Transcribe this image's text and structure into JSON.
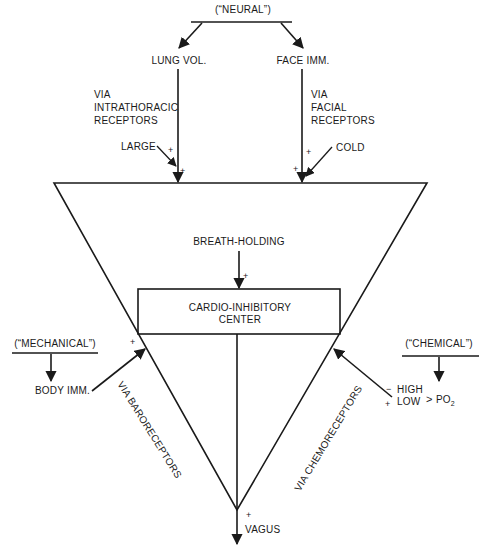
{
  "diagram": {
    "type": "cardio-inhibitory reflex pathway diagram",
    "groups": {
      "neural": {
        "label": "(“NEURAL”)"
      },
      "mechanical": {
        "label": "(“MECHANICAL”)"
      },
      "chemical": {
        "label": "(“CHEMICAL”)"
      }
    },
    "inputs": {
      "lung_vol": {
        "label": "LUNG VOL.",
        "pathway": [
          "VIA",
          "INTRATHORACIC",
          "RECEPTORS"
        ],
        "modifier": "LARGE",
        "sign1": "+",
        "sign2": "+"
      },
      "face_imm": {
        "label": "FACE IMM.",
        "pathway": [
          "VIA",
          "FACIAL",
          "RECEPTORS"
        ],
        "modifier": "COLD",
        "sign1": "+",
        "sign2": "+"
      },
      "breath_holding": {
        "label": "BREATH-HOLDING",
        "sign": "+"
      },
      "body_imm": {
        "label": "BODY IMM.",
        "pathway": "VIA BARORECEPTORS",
        "sign": "+"
      },
      "po2": {
        "high": "HIGH",
        "low": "LOW",
        "param": "PO",
        "param_sub": "2",
        "sign_high": "−",
        "sign_low": "+",
        "pathway": "VIA CHEMORECEPTORS",
        "bracket": ">"
      }
    },
    "center": {
      "line1": "CARDIO-INHIBITORY",
      "line2": "CENTER"
    },
    "output": {
      "label": "VAGUS",
      "sign": "+"
    }
  }
}
